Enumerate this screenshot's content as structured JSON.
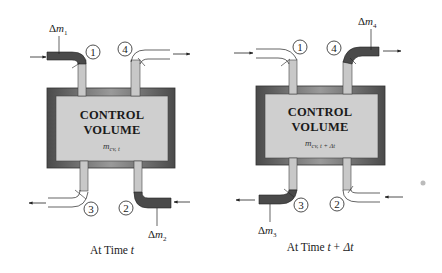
{
  "figure": {
    "colors": {
      "frame_dark": "#5a5a5a",
      "frame_light": "#8a8a8a",
      "fill": "#cfcfcf",
      "pipe": "#c8c8c8",
      "mass_element": "#4a4a4a",
      "line": "#222222"
    },
    "panels": [
      {
        "caption_prefix": "At Time ",
        "caption_var": "t",
        "caption_suffix": "",
        "cv_title_line1": "CONTROL",
        "cv_title_line2": "VOLUME",
        "cv_mass": "m",
        "cv_mass_sub": "cv, t",
        "ports": [
          "1",
          "4",
          "3",
          "2"
        ],
        "mass_labels": [
          {
            "delta": "Δ",
            "var": "m",
            "sub": "1"
          },
          {
            "delta": "Δ",
            "var": "m",
            "sub": "2"
          }
        ]
      },
      {
        "caption_prefix": "At Time ",
        "caption_var": "t",
        "caption_suffix": "+ Δt",
        "cv_title_line1": "CONTROL",
        "cv_title_line2": "VOLUME",
        "cv_mass": "m",
        "cv_mass_sub": "cv, t + Δt",
        "ports": [
          "1",
          "4",
          "3",
          "2"
        ],
        "mass_labels": [
          {
            "delta": "Δ",
            "var": "m",
            "sub": "4"
          },
          {
            "delta": "Δ",
            "var": "m",
            "sub": "3"
          }
        ]
      }
    ]
  }
}
